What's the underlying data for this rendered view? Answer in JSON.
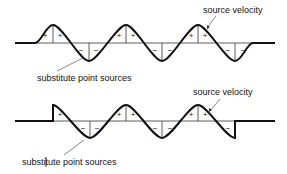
{
  "diagram": {
    "top": {
      "label_sources": "substitute point sources",
      "label_velocity": "source velocity",
      "signs": [
        {
          "x": 45,
          "y": 38,
          "t": "+"
        },
        {
          "x": 60,
          "y": 38,
          "t": "+"
        },
        {
          "x": 81,
          "y": 53,
          "t": "−"
        },
        {
          "x": 96,
          "y": 53,
          "t": "−"
        },
        {
          "x": 119,
          "y": 38,
          "t": "+"
        },
        {
          "x": 133,
          "y": 38,
          "t": "+"
        },
        {
          "x": 155,
          "y": 53,
          "t": "−"
        },
        {
          "x": 170,
          "y": 53,
          "t": "−"
        },
        {
          "x": 191,
          "y": 38,
          "t": "+"
        },
        {
          "x": 205,
          "y": 38,
          "t": "+"
        },
        {
          "x": 228,
          "y": 53,
          "t": "−"
        },
        {
          "x": 243,
          "y": 53,
          "t": "−"
        }
      ]
    },
    "bottom": {
      "label_sources": "substitute point sources",
      "label_velocity": "source velocity",
      "signs": [
        {
          "x": 60,
          "y": 117,
          "t": "+"
        },
        {
          "x": 83,
          "y": 131,
          "t": "−"
        },
        {
          "x": 97,
          "y": 131,
          "t": "−"
        },
        {
          "x": 119,
          "y": 117,
          "t": "+"
        },
        {
          "x": 133,
          "y": 117,
          "t": "+"
        },
        {
          "x": 155,
          "y": 131,
          "t": "−"
        },
        {
          "x": 170,
          "y": 131,
          "t": "−"
        },
        {
          "x": 191,
          "y": 117,
          "t": "+"
        },
        {
          "x": 205,
          "y": 117,
          "t": "+"
        },
        {
          "x": 228,
          "y": 131,
          "t": "−"
        }
      ]
    }
  }
}
